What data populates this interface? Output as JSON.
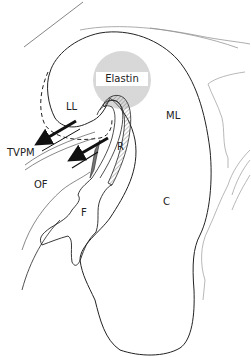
{
  "diagram": {
    "labels": {
      "elastin": "Elastin",
      "ll": "LL",
      "ml": "ML",
      "tvpm": "TVPM",
      "r": "R",
      "of": "OF",
      "f": "F",
      "c": "C"
    },
    "colors": {
      "line": "#222222",
      "light_line": "#888888",
      "hatch": "#9a9a9a",
      "fill_dark": "#777777",
      "background": "#ffffff"
    }
  }
}
